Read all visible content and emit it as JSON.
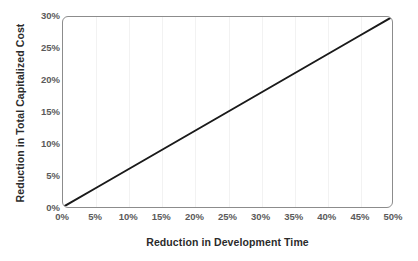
{
  "chart_data": {
    "type": "line",
    "title": "",
    "xlabel": "Reduction in Development Time",
    "ylabel": "Reduction in Total Capitalized Cost",
    "xlim": [
      0,
      50
    ],
    "ylim": [
      0,
      30
    ],
    "x_tick_labels": [
      "0%",
      "5%",
      "10%",
      "15%",
      "20%",
      "25%",
      "30%",
      "35%",
      "40%",
      "45%",
      "50%"
    ],
    "x_tick_values": [
      0,
      5,
      10,
      15,
      20,
      25,
      30,
      35,
      40,
      45,
      50
    ],
    "y_tick_labels": [
      "0%",
      "5%",
      "10%",
      "15%",
      "20%",
      "25%",
      "30%"
    ],
    "y_tick_values": [
      0,
      5,
      10,
      15,
      20,
      25,
      30
    ],
    "grid": "vertical-only-faint",
    "legend": "none",
    "series": [
      {
        "name": "Reduction in Total Capitalized Cost",
        "color": "#1a1a1a",
        "line_width": 2,
        "x": [
          0,
          5,
          10,
          15,
          20,
          25,
          30,
          35,
          40,
          45,
          50
        ],
        "values": [
          0,
          3,
          6,
          9,
          12,
          15,
          18,
          21,
          24,
          27,
          30
        ]
      }
    ]
  },
  "axes": {
    "frame_color": "#8c8c8c",
    "gridline_color": "#f2f2f2",
    "tick_label_color": "#5a5a5a",
    "axis_title_color": "#2b2b2b",
    "background": "#ffffff"
  }
}
